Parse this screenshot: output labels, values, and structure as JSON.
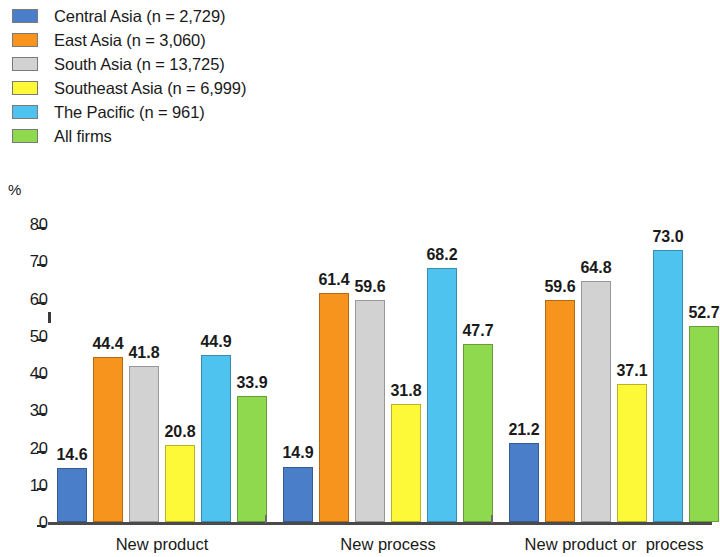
{
  "chart_data": {
    "type": "bar",
    "title": "",
    "subtitle": "",
    "xlabel": "",
    "ylabel": "%",
    "ylim": [
      0,
      80
    ],
    "ytick_values": [
      0,
      10,
      20,
      30,
      40,
      50,
      60,
      70,
      80
    ],
    "ytick_labels": [
      "0",
      "10",
      "20",
      "30",
      "40",
      "50",
      "60",
      "70",
      "80"
    ],
    "grid": false,
    "legend_position": "top-left",
    "categories": [
      "New product",
      "New process",
      "New product or  process"
    ],
    "series": [
      {
        "name": "Central Asia (n = 2,729)",
        "color": "#4a7ec9",
        "values": [
          14.6,
          14.9,
          21.2
        ]
      },
      {
        "name": "East Asia (n = 3,060)",
        "color": "#f7941e",
        "values": [
          44.4,
          61.4,
          59.6
        ]
      },
      {
        "name": "South Asia (n = 13,725)",
        "color": "#d2d2d2",
        "values": [
          41.8,
          59.6,
          64.8
        ]
      },
      {
        "name": "Southeast Asia (n = 6,999)",
        "color": "#fdf838",
        "values": [
          20.8,
          31.8,
          37.1
        ]
      },
      {
        "name": "The Pacific (n = 961)",
        "color": "#4fc3f0",
        "values": [
          44.9,
          68.2,
          73.0
        ]
      },
      {
        "name": "All firms",
        "color": "#8fd94e",
        "values": [
          33.9,
          47.7,
          52.7
        ]
      }
    ],
    "value_labels": [
      [
        "14.6",
        "44.4",
        "41.8",
        "20.8",
        "44.9",
        "33.9"
      ],
      [
        "14.9",
        "61.4",
        "59.6",
        "31.8",
        "68.2",
        "47.7"
      ],
      [
        "21.2",
        "59.6",
        "64.8",
        "37.1",
        "73.0",
        "52.7"
      ]
    ]
  },
  "legend": {
    "items": [
      {
        "label": "Central Asia (n = 2,729)",
        "color": "#4a7ec9"
      },
      {
        "label": "East Asia (n = 3,060)",
        "color": "#f7941e"
      },
      {
        "label": "South Asia (n = 13,725)",
        "color": "#d2d2d2"
      },
      {
        "label": "Southeast Asia (n = 6,999)",
        "color": "#fdf838"
      },
      {
        "label": "The Pacific (n = 961)",
        "color": "#4fc3f0"
      },
      {
        "label": "All firms",
        "color": "#8fd94e"
      }
    ]
  },
  "axis": {
    "unit_label": "%"
  }
}
